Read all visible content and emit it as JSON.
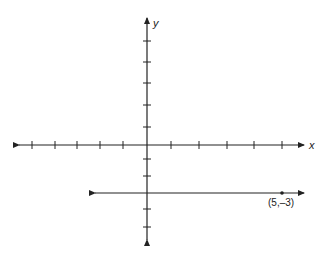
{
  "diagram": {
    "type": "coordinate-plane",
    "x_axis_label": "x",
    "y_axis_label": "y",
    "origin_px": [
      147,
      145
    ],
    "x_axis_extent_px": [
      19,
      304
    ],
    "y_axis_extent_px": [
      18,
      240
    ],
    "x_ticks_px": [
      32,
      55,
      77,
      100,
      123,
      171,
      199,
      227,
      254,
      282
    ],
    "y_ticks_px": [
      41,
      62,
      83,
      105,
      127,
      159,
      176,
      209,
      227
    ],
    "horizontal_line": {
      "y_px": 193,
      "x_extent_px": [
        95,
        304
      ],
      "equation_value": -3
    },
    "point": {
      "label": "(5,–3)",
      "px": [
        282,
        193
      ]
    },
    "color": "#222222"
  }
}
